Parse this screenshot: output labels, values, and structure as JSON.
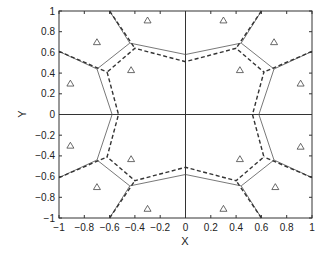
{
  "chart_data": {
    "type": "line",
    "title": "",
    "xlabel": "X",
    "ylabel": "Y",
    "xlim": [
      -1,
      1
    ],
    "ylim": [
      -1,
      1
    ],
    "xticks": [
      -1,
      -0.8,
      -0.6,
      -0.4,
      -0.2,
      0,
      0.2,
      0.4,
      0.6,
      0.8,
      1
    ],
    "yticks": [
      -1,
      -0.8,
      -0.6,
      -0.4,
      -0.2,
      0,
      0.2,
      0.4,
      0.6,
      0.8,
      1
    ],
    "xtick_labels": [
      "−1",
      "−0.8",
      "−0.6",
      "−0.4",
      "−0.2",
      "0",
      "0.2",
      "0.4",
      "0.6",
      "0.8",
      "1"
    ],
    "ytick_labels": [
      "−1",
      "−0.8",
      "−0.6",
      "−0.4",
      "−0.2",
      "0",
      "0.2",
      "0.4",
      "0.6",
      "0.8",
      "1"
    ],
    "grid": false,
    "reference_lines": [
      {
        "orientation": "horizontal",
        "value": 0
      },
      {
        "orientation": "vertical",
        "value": 0
      }
    ],
    "series": [
      {
        "name": "sites",
        "style": "triangle-marker",
        "points": [
          [
            -0.3,
            0.91
          ],
          [
            -0.7,
            0.7
          ],
          [
            -0.43,
            0.43
          ],
          [
            -0.91,
            0.3
          ],
          [
            0.3,
            0.91
          ],
          [
            0.7,
            0.7
          ],
          [
            0.43,
            0.43
          ],
          [
            0.91,
            0.3
          ],
          [
            -0.91,
            -0.3
          ],
          [
            -0.43,
            -0.43
          ],
          [
            -0.7,
            -0.7
          ],
          [
            -0.3,
            -0.91
          ],
          [
            0.91,
            -0.31
          ],
          [
            0.43,
            -0.43
          ],
          [
            0.71,
            -0.7
          ],
          [
            0.3,
            -0.91
          ]
        ]
      },
      {
        "name": "voronoi-solid-inner",
        "style": "solid",
        "points": [
          [
            -0.7,
            0.44
          ],
          [
            -0.58,
            0
          ],
          [
            -0.7,
            -0.44
          ],
          [
            -0.44,
            -0.69
          ],
          [
            0,
            -0.58
          ],
          [
            0.44,
            -0.69
          ],
          [
            0.7,
            -0.44
          ],
          [
            0.58,
            0
          ],
          [
            0.7,
            0.44
          ],
          [
            0.44,
            0.69
          ],
          [
            0,
            0.58
          ],
          [
            -0.44,
            0.69
          ],
          [
            -0.7,
            0.44
          ]
        ]
      },
      {
        "name": "voronoi-dashed-inner",
        "style": "dashed",
        "points": [
          [
            -0.62,
            0.41
          ],
          [
            -0.53,
            0
          ],
          [
            -0.62,
            -0.41
          ],
          [
            -0.4,
            -0.64
          ],
          [
            0,
            -0.51
          ],
          [
            0.4,
            -0.64
          ],
          [
            0.62,
            -0.41
          ],
          [
            0.53,
            0
          ],
          [
            0.62,
            0.41
          ],
          [
            0.4,
            0.64
          ],
          [
            0,
            0.51
          ],
          [
            -0.4,
            0.64
          ],
          [
            -0.62,
            0.41
          ]
        ]
      },
      {
        "name": "voronoi-outer-edges",
        "style": "solid+dashed",
        "segments": [
          {
            "from": [
              -1,
              0.61
            ],
            "solid_to": [
              -0.7,
              0.44
            ],
            "dashed_to": [
              -0.62,
              0.41
            ]
          },
          {
            "from": [
              -0.6,
              1
            ],
            "solid_to": [
              -0.44,
              0.69
            ],
            "dashed_to": [
              -0.4,
              0.64
            ]
          },
          {
            "from": [
              0.6,
              1
            ],
            "solid_to": [
              0.44,
              0.69
            ],
            "dashed_to": [
              0.4,
              0.64
            ]
          },
          {
            "from": [
              1,
              0.61
            ],
            "solid_to": [
              0.7,
              0.44
            ],
            "dashed_to": [
              0.62,
              0.41
            ]
          },
          {
            "from": [
              -1,
              -0.61
            ],
            "solid_to": [
              -0.7,
              -0.44
            ],
            "dashed_to": [
              -0.62,
              -0.41
            ]
          },
          {
            "from": [
              -0.6,
              -1
            ],
            "solid_to": [
              -0.44,
              -0.69
            ],
            "dashed_to": [
              -0.4,
              -0.64
            ]
          },
          {
            "from": [
              0.6,
              -1
            ],
            "solid_to": [
              0.44,
              -0.69
            ],
            "dashed_to": [
              0.4,
              -0.64
            ]
          },
          {
            "from": [
              1,
              -0.61
            ],
            "solid_to": [
              0.7,
              -0.44
            ],
            "dashed_to": [
              0.62,
              -0.41
            ]
          }
        ]
      }
    ],
    "legend": null
  },
  "layout": {
    "plot_left": 59,
    "plot_top": 11,
    "plot_right": 312,
    "plot_bottom": 218,
    "line_color": "#333333",
    "solid_color": "#555555",
    "marker_color": "#444444"
  }
}
